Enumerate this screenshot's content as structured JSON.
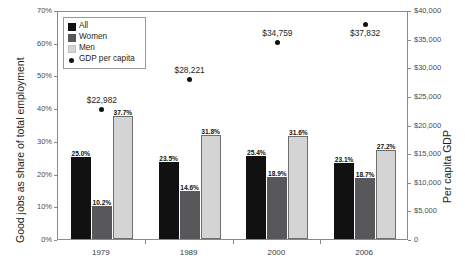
{
  "chart_data": {
    "type": "bar",
    "title": "",
    "subtitle": "",
    "categories": [
      "1979",
      "1989",
      "2000",
      "2006"
    ],
    "series": [
      {
        "name": "All",
        "values": [
          25.0,
          23.5,
          25.4,
          23.1
        ],
        "color": "#111111",
        "axis": "left"
      },
      {
        "name": "Women",
        "values": [
          10.2,
          14.6,
          18.9,
          18.7
        ],
        "color": "#58585a",
        "axis": "left"
      },
      {
        "name": "Men",
        "values": [
          37.7,
          31.8,
          31.6,
          27.2
        ],
        "color": "#d4d4d4",
        "axis": "left"
      },
      {
        "name": "GDP per capita",
        "values": [
          22982,
          28221,
          34759,
          37832
        ],
        "color": "#111111",
        "axis": "right",
        "type": "scatter"
      }
    ],
    "bar_labels": [
      [
        "25.0%",
        "10.2%",
        "37.7%"
      ],
      [
        "23.5%",
        "14.6%",
        "31.8%"
      ],
      [
        "25.4%",
        "18.9%",
        "31.6%"
      ],
      [
        "23.1%",
        "18.7%",
        "27.2%"
      ]
    ],
    "gdp_labels": [
      "$22,982",
      "$28,221",
      "$34,759",
      "$37,832"
    ],
    "xlabel": "",
    "ylabel": "Good jobs as share of total employment",
    "ylabel_right": "Per capita GDP",
    "ylim": [
      0,
      70
    ],
    "ylim_right": [
      0,
      40000
    ],
    "yticks": [
      "0%",
      "10%",
      "20%",
      "30%",
      "40%",
      "50%",
      "60%",
      "70%"
    ],
    "ytick_values": [
      0,
      10,
      20,
      30,
      40,
      50,
      60,
      70
    ],
    "yticks_right": [
      "0",
      "$5,000",
      "$10,000",
      "$15,000",
      "$20,000",
      "$25,000",
      "$30,000",
      "$35,000",
      "$40,000"
    ],
    "ytick_values_right": [
      0,
      5000,
      10000,
      15000,
      20000,
      25000,
      30000,
      35000,
      40000
    ],
    "grid": false,
    "legend_position": "top-left",
    "legend": [
      {
        "label": "All",
        "swatch": "all"
      },
      {
        "label": "Women",
        "swatch": "women"
      },
      {
        "label": "Men",
        "swatch": "men"
      },
      {
        "label": "GDP per capita",
        "swatch": "dot"
      }
    ]
  }
}
